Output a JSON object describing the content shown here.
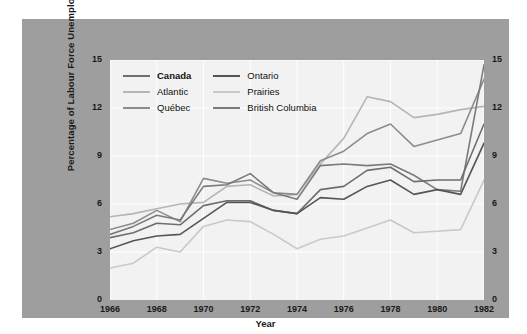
{
  "chart_data": {
    "type": "line",
    "title": "",
    "xlabel": "Year",
    "ylabel": "Percentage of Labour Force Unemployed",
    "xlim": [
      1966,
      1982
    ],
    "ylim": [
      0,
      15
    ],
    "ytick_labels": [
      "15",
      "12",
      "9",
      "6",
      "3",
      "0"
    ],
    "ytick_values": [
      15,
      12,
      9,
      6,
      3,
      0
    ],
    "xtick_labels": [
      "1966",
      "1968",
      "1970",
      "1972",
      "1974",
      "1976",
      "1978",
      "1980",
      "1982"
    ],
    "xtick_values": [
      1966,
      1968,
      1970,
      1972,
      1974,
      1976,
      1978,
      1980,
      1982
    ],
    "grid": true,
    "legend_position": "top-left-inside",
    "x": [
      1966,
      1967,
      1968,
      1969,
      1970,
      1971,
      1972,
      1973,
      1974,
      1975,
      1976,
      1977,
      1978,
      1979,
      1980,
      1981,
      1982
    ],
    "series": [
      {
        "name": "Canada",
        "color": "#6e6e6e",
        "values": [
          3.9,
          4.2,
          4.8,
          4.7,
          5.9,
          6.2,
          6.2,
          5.6,
          5.4,
          6.9,
          7.1,
          8.1,
          8.3,
          7.4,
          7.5,
          7.5,
          11.0
        ]
      },
      {
        "name": "Atlantic",
        "color": "#b5b5b5",
        "values": [
          5.2,
          5.4,
          5.7,
          6.0,
          6.1,
          7.1,
          7.2,
          6.5,
          6.6,
          8.5,
          10.1,
          12.7,
          12.4,
          11.4,
          11.6,
          11.9,
          12.1
        ]
      },
      {
        "name": "Québec",
        "color": "#8c8c8c",
        "values": [
          4.4,
          4.8,
          5.6,
          4.9,
          7.6,
          7.3,
          7.5,
          6.7,
          6.6,
          8.7,
          9.3,
          10.4,
          11.0,
          9.6,
          10.0,
          10.4,
          13.8
        ]
      },
      {
        "name": "Ontario",
        "color": "#555555",
        "values": [
          3.2,
          3.7,
          4.0,
          4.1,
          5.1,
          6.1,
          6.1,
          5.6,
          5.4,
          6.4,
          6.3,
          7.1,
          7.5,
          6.6,
          6.9,
          6.6,
          9.8
        ]
      },
      {
        "name": "Prairies",
        "color": "#c9c9c9",
        "values": [
          2.0,
          2.3,
          3.3,
          3.0,
          4.6,
          5.0,
          4.9,
          4.1,
          3.2,
          3.8,
          4.0,
          4.5,
          5.0,
          4.2,
          4.3,
          4.4,
          7.5
        ]
      },
      {
        "name": "British Columbia",
        "color": "#7a7a7a",
        "values": [
          4.1,
          4.6,
          5.3,
          5.0,
          7.1,
          7.2,
          7.9,
          6.7,
          6.3,
          8.4,
          8.5,
          8.4,
          8.5,
          7.8,
          6.9,
          6.8,
          14.7
        ]
      }
    ]
  },
  "legend": {
    "entries": [
      {
        "label": "Canada",
        "bold": true
      },
      {
        "label": "Ontario",
        "bold": false
      },
      {
        "label": "Atlantic",
        "bold": false
      },
      {
        "label": "Prairies",
        "bold": false
      },
      {
        "label": "Québec",
        "bold": false
      },
      {
        "label": "British Columbia",
        "bold": false
      }
    ]
  },
  "colors": {
    "figure_background": "#9e9e9e",
    "plot_background": "#f2f2f2",
    "page_background": "#ffffff",
    "gridline": "#ffffff",
    "text": "#1a1a1a"
  }
}
